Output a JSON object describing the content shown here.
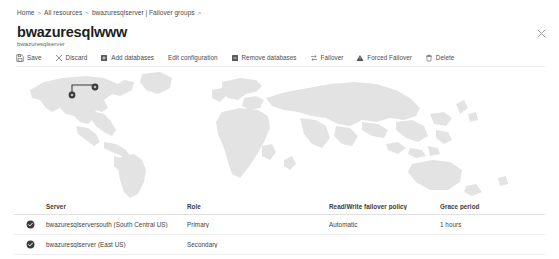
{
  "breadcrumb": {
    "name": "breadcrumb",
    "items": [
      "Home",
      "All resources",
      "bwazuresqlserver | Failover groups"
    ],
    "separator": ">",
    "trailing_separator": ">"
  },
  "header": {
    "title": "bwazuresqlwww",
    "subtitle": "bwazuresqlserver",
    "close_icon": "close-icon"
  },
  "toolbar": {
    "items": [
      {
        "label": "Save",
        "icon": "save-icon"
      },
      {
        "label": "Discard",
        "icon": "discard-x-icon"
      },
      {
        "label": "Add databases",
        "icon": "add-database-icon"
      },
      {
        "label": "Edit configuration",
        "icon": ""
      },
      {
        "label": "Remove databases",
        "icon": "remove-database-icon"
      },
      {
        "label": "Failover",
        "icon": "failover-swap-icon"
      },
      {
        "label": "Forced Failover",
        "icon": "warning-triangle-icon"
      },
      {
        "label": "Delete",
        "icon": "trash-icon"
      }
    ]
  },
  "map": {
    "name": "world-map",
    "land_color": "#e3e3e3",
    "marker_color": "#3b3b3b",
    "markers": [
      {
        "name": "map-marker-south-central-us",
        "x": 72,
        "y": 27
      },
      {
        "name": "map-marker-east-us",
        "x": 95,
        "y": 19
      }
    ]
  },
  "table": {
    "columns": [
      "Server",
      "Role",
      "Read/Write failover policy",
      "Grace period"
    ],
    "rows": [
      {
        "status_icon": "status-check-icon",
        "server": "bwazuresqlserversouth (South Central US)",
        "role": "Primary",
        "policy": "Automatic",
        "grace": "1 hours"
      },
      {
        "status_icon": "status-check-icon",
        "server": "bwazuresqlserver (East US)",
        "role": "Secondary",
        "policy": "",
        "grace": ""
      }
    ]
  }
}
